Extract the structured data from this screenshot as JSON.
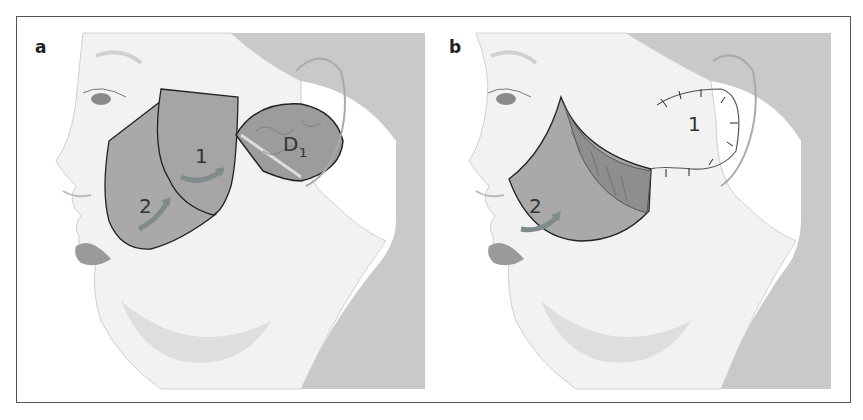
{
  "figure": {
    "panels": [
      {
        "label": "a",
        "annotations": {
          "flap_1": "1",
          "flap_2": "2",
          "defect": "D",
          "defect_subscript": "1"
        }
      },
      {
        "label": "b",
        "annotations": {
          "flap_1": "1",
          "flap_2": "2"
        }
      }
    ],
    "colors": {
      "background_skin": "#f4f4f4",
      "neck_shadow": "#c9c9c9",
      "flap_fill": "#a9a9a9",
      "arrow": "#7f8a8a",
      "outline": "#222222",
      "frame": "#555555"
    }
  }
}
